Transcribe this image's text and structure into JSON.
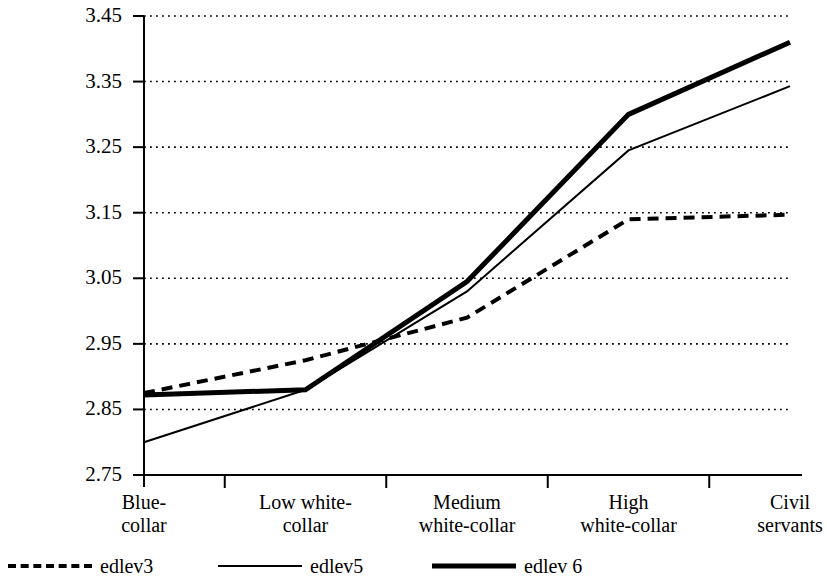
{
  "chart_data": {
    "type": "line",
    "title": "",
    "subtitle": "",
    "xlabel": "",
    "ylabel": "",
    "categories": [
      "Blue-\ncollar",
      "Low white-\ncollar",
      "Medium\nwhite-collar",
      "High\nwhite-collar",
      "Civil\nservants"
    ],
    "category_lines": [
      [
        "Blue-",
        "collar"
      ],
      [
        "Low white-",
        "collar"
      ],
      [
        "Medium",
        "white-collar"
      ],
      [
        "High",
        "white-collar"
      ],
      [
        "Civil",
        "servants"
      ]
    ],
    "ylim": [
      2.75,
      3.45
    ],
    "yticks": [
      2.75,
      2.85,
      2.95,
      3.05,
      3.15,
      3.25,
      3.35,
      3.45
    ],
    "ytick_labels": [
      "2.75",
      "2.85",
      "2.95",
      "3.05",
      "3.15",
      "3.25",
      "3.35",
      "3.45"
    ],
    "grid": true,
    "grid_style": "dotted",
    "legend_position": "bottom",
    "series": [
      {
        "name": "edlev3",
        "style": "dashed",
        "width": 4,
        "color": "#000000",
        "values": [
          2.875,
          2.925,
          2.99,
          3.14,
          3.147
        ]
      },
      {
        "name": "edlev5",
        "style": "solid",
        "width": 2,
        "color": "#000000",
        "values": [
          2.8,
          2.88,
          3.03,
          3.245,
          3.343
        ]
      },
      {
        "name": "edlev 6",
        "style": "solid",
        "width": 5,
        "color": "#000000",
        "values": [
          2.872,
          2.88,
          3.045,
          3.3,
          3.41
        ]
      }
    ]
  },
  "legend": {
    "entries": [
      {
        "label": "edlev3",
        "style": "dotted"
      },
      {
        "label": "edlev5",
        "style": "thin"
      },
      {
        "label": "edlev 6",
        "style": "thick"
      }
    ]
  }
}
